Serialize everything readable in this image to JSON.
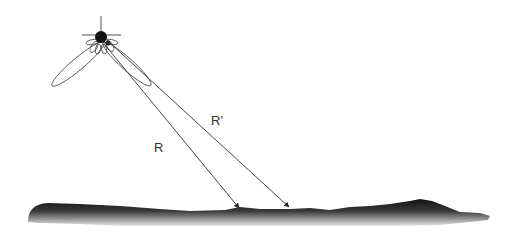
{
  "diagram": {
    "type": "radar-altimeter-geometry",
    "labels": {
      "range_direct": "R",
      "range_offset": "R'"
    },
    "elements": {
      "satellite": "satellite-with-antenna-pattern",
      "terrain": "ground-surface-profile"
    },
    "colors": {
      "line": "#333333",
      "terrain_top": "#1a1a1a",
      "terrain_bottom": "#d0d0d0",
      "background": "#ffffff"
    }
  }
}
